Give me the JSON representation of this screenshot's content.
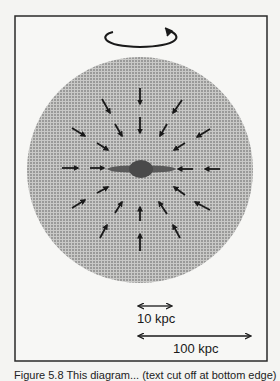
{
  "figure": {
    "frame": {
      "x": 15,
      "y": 16,
      "width": 252,
      "height": 345
    },
    "halo": {
      "cx": 140,
      "cy": 170,
      "r": 113,
      "fill": "#b8b8b8",
      "dot_color": "#6a6a6a"
    },
    "galaxy": {
      "disk_x1": 107,
      "disk_x2": 176,
      "cy": 169,
      "bulge_rx": 12,
      "bulge_ry": 9,
      "color": "#555555"
    },
    "rotation_icon": "counter-rotation-arrow-icon",
    "infall_arrows": [
      {
        "x1": 140,
        "y1": 88,
        "x2": 140,
        "y2": 104
      },
      {
        "x1": 140,
        "y1": 117,
        "x2": 140,
        "y2": 133
      },
      {
        "x1": 102,
        "y1": 99,
        "x2": 110,
        "y2": 113
      },
      {
        "x1": 115,
        "y1": 124,
        "x2": 122,
        "y2": 136
      },
      {
        "x1": 182,
        "y1": 100,
        "x2": 173,
        "y2": 113
      },
      {
        "x1": 167,
        "y1": 124,
        "x2": 160,
        "y2": 136
      },
      {
        "x1": 72,
        "y1": 128,
        "x2": 85,
        "y2": 136
      },
      {
        "x1": 97,
        "y1": 143,
        "x2": 108,
        "y2": 150
      },
      {
        "x1": 210,
        "y1": 129,
        "x2": 197,
        "y2": 137
      },
      {
        "x1": 185,
        "y1": 143,
        "x2": 174,
        "y2": 150
      },
      {
        "x1": 62,
        "y1": 168,
        "x2": 78,
        "y2": 168
      },
      {
        "x1": 90,
        "y1": 168,
        "x2": 104,
        "y2": 168
      },
      {
        "x1": 193,
        "y1": 169,
        "x2": 178,
        "y2": 169
      },
      {
        "x1": 220,
        "y1": 169,
        "x2": 205,
        "y2": 169
      },
      {
        "x1": 97,
        "y1": 193,
        "x2": 108,
        "y2": 187
      },
      {
        "x1": 72,
        "y1": 208,
        "x2": 85,
        "y2": 200
      },
      {
        "x1": 185,
        "y1": 195,
        "x2": 174,
        "y2": 187
      },
      {
        "x1": 210,
        "y1": 210,
        "x2": 195,
        "y2": 202
      },
      {
        "x1": 115,
        "y1": 213,
        "x2": 122,
        "y2": 202
      },
      {
        "x1": 167,
        "y1": 214,
        "x2": 159,
        "y2": 202
      },
      {
        "x1": 140,
        "y1": 221,
        "x2": 140,
        "y2": 207
      },
      {
        "x1": 100,
        "y1": 238,
        "x2": 107,
        "y2": 225
      },
      {
        "x1": 180,
        "y1": 238,
        "x2": 173,
        "y2": 225
      },
      {
        "x1": 140,
        "y1": 251,
        "x2": 140,
        "y2": 234
      }
    ],
    "scale_bars": [
      {
        "label": "10 kpc",
        "x1": 137,
        "x2": 173,
        "y": 306,
        "label_x": 137,
        "label_y": 323
      },
      {
        "label": "100 kpc",
        "x1": 137,
        "x2": 252,
        "y": 336,
        "label_x": 173,
        "label_y": 353
      }
    ]
  },
  "caption": "Figure 5.8  This diagram... (text cut off at bottom edge)"
}
